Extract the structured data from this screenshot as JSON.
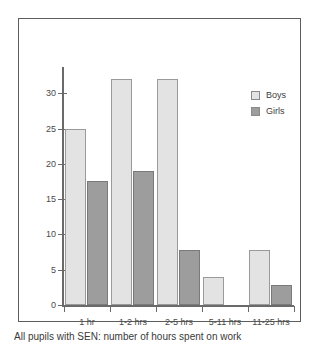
{
  "chart_data": {
    "type": "bar",
    "title": "",
    "xlabel": "",
    "ylabel": "",
    "categories": [
      "1 hr",
      "1-2 hrs",
      "2-5 hrs",
      "5-11 hrs",
      "11-25 hrs"
    ],
    "series": [
      {
        "name": "Boys",
        "color": "#e3e3e3",
        "values": [
          25,
          32,
          32,
          4,
          7.8
        ]
      },
      {
        "name": "Girls",
        "color": "#9d9d9d",
        "values": [
          17.5,
          19,
          7.8,
          0,
          2.8
        ]
      }
    ],
    "yticks": [
      0,
      5,
      10,
      15,
      20,
      25,
      30
    ],
    "ytick_labels": [
      "0",
      "5",
      "10",
      "15",
      "20",
      "25",
      "30"
    ],
    "ylim": [
      0,
      34
    ],
    "grid": false,
    "legend_position": "top-right"
  },
  "legend": {
    "items": [
      {
        "label": "Boys"
      },
      {
        "label": "Girls"
      }
    ]
  },
  "caption": {
    "text": "All pupils with SEN: number of hours spent on work"
  }
}
